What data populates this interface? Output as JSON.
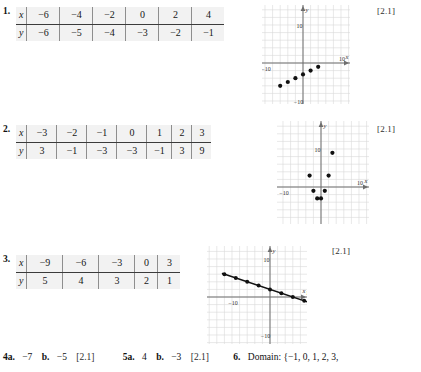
{
  "page": {
    "width": 421,
    "height": 372,
    "background": "#ffffff",
    "table_background": "#f2f2f2",
    "grid_color": "#d8d8d8",
    "axis_color": "#6e6e6e",
    "point_color": "#111111"
  },
  "problems": [
    {
      "number": "1.",
      "section_tag": "[2.1]",
      "table": {
        "row_labels": [
          "x",
          "y"
        ],
        "x": [
          "−6",
          "−4",
          "−2",
          "0",
          "2",
          "4"
        ],
        "y": [
          "−6",
          "−5",
          "−4",
          "−3",
          "−2",
          "−1"
        ]
      },
      "graph": {
        "type": "scatter",
        "x_label": "x",
        "y_label": "y",
        "x_tick_labels": [
          "−10",
          "10"
        ],
        "y_tick_labels": [
          "10",
          "−10"
        ],
        "xlim": [
          -13,
          13
        ],
        "ylim": [
          -13,
          13
        ],
        "grid": true,
        "points": [
          {
            "x": -6,
            "y": -6
          },
          {
            "x": -4,
            "y": -5
          },
          {
            "x": -2,
            "y": -4
          },
          {
            "x": 0,
            "y": -3
          },
          {
            "x": 2,
            "y": -2
          },
          {
            "x": 4,
            "y": -1
          }
        ],
        "line": false
      }
    },
    {
      "number": "2.",
      "section_tag": "[2.1]",
      "table": {
        "row_labels": [
          "x",
          "y"
        ],
        "x": [
          "−3",
          "−2",
          "−1",
          "0",
          "1",
          "2",
          "3"
        ],
        "y": [
          "3",
          "−1",
          "−3",
          "−3",
          "−1",
          "3",
          "9"
        ]
      },
      "graph": {
        "type": "scatter",
        "x_label": "x",
        "y_label": "y",
        "x_tick_labels": [
          "−10",
          "10"
        ],
        "y_tick_labels": [
          "10",
          "−10"
        ],
        "xlim": [
          -13,
          13
        ],
        "ylim": [
          -13,
          13
        ],
        "grid": true,
        "points": [
          {
            "x": -3,
            "y": 3
          },
          {
            "x": -2,
            "y": -1
          },
          {
            "x": -1,
            "y": -3
          },
          {
            "x": 0,
            "y": -3
          },
          {
            "x": 1,
            "y": -1
          },
          {
            "x": 2,
            "y": 3
          },
          {
            "x": 3,
            "y": 9
          }
        ],
        "line": false
      }
    },
    {
      "number": "3.",
      "section_tag": "[2.1]",
      "table": {
        "row_labels": [
          "x",
          "y"
        ],
        "x": [
          "−9",
          "−6",
          "−3",
          "0",
          "3"
        ],
        "y": [
          "5",
          "4",
          "3",
          "2",
          "1"
        ]
      },
      "graph": {
        "type": "line",
        "x_label": "x",
        "y_label": "y",
        "x_tick_labels": [
          "−10",
          "10"
        ],
        "y_tick_labels": [
          "10",
          "−10"
        ],
        "xlim": [
          -13,
          13
        ],
        "ylim": [
          -13,
          13
        ],
        "grid": true,
        "points": [
          {
            "x": -12,
            "y": 6
          },
          {
            "x": -9,
            "y": 5
          },
          {
            "x": -6,
            "y": 4
          },
          {
            "x": -3,
            "y": 3
          },
          {
            "x": 0,
            "y": 2
          },
          {
            "x": 3,
            "y": 1
          },
          {
            "x": 6,
            "y": 0
          },
          {
            "x": 9,
            "y": -1
          }
        ],
        "line": true,
        "line_from": {
          "x": -12.5,
          "y": 6.2
        },
        "line_to": {
          "x": 10.5,
          "y": -1.5
        }
      }
    }
  ],
  "answers": {
    "item4": {
      "number": "4a.",
      "value_a": "−7",
      "part_b": "b.",
      "value_b": "−5",
      "section_tag": "[2.1]"
    },
    "item5": {
      "number": "5a.",
      "value_a": "4",
      "part_b": "b.",
      "value_b": "−3",
      "section_tag": "[2.1]"
    },
    "item6": {
      "number": "6.",
      "text": "Domain: {−1, 0, 1, 2, 3,"
    }
  }
}
